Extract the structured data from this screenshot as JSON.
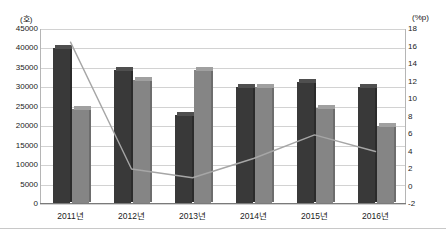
{
  "chart_data": {
    "type": "bar",
    "title": "",
    "subtitle": "",
    "xlabel": "",
    "ylabel": "(호)",
    "y2label": "(%p)",
    "categories": [
      "2011년",
      "2012년",
      "2013년",
      "2014년",
      "2015년",
      "2016년"
    ],
    "series": [
      {
        "name": "series-dark-bar",
        "type": "bar",
        "axis": "left",
        "color": "#393939",
        "values": [
          40000,
          34500,
          23000,
          30000,
          31500,
          30000
        ]
      },
      {
        "name": "series-gray-bar",
        "type": "bar",
        "axis": "left",
        "color": "#858585",
        "values": [
          24500,
          32000,
          34500,
          30200,
          24800,
          20000
        ]
      },
      {
        "name": "series-line",
        "type": "line",
        "axis": "right",
        "color": "#a6a6a6",
        "values": [
          16.5,
          2.0,
          1.0,
          3.2,
          5.9,
          4.0
        ]
      }
    ],
    "ylim": [
      0,
      45000
    ],
    "yticks": [
      "45000",
      "40000",
      "35000",
      "30000",
      "25000",
      "20000",
      "15000",
      "10000",
      "5000",
      "0"
    ],
    "ytick_values": [
      45000,
      40000,
      35000,
      30000,
      25000,
      20000,
      15000,
      10000,
      5000,
      0
    ],
    "y2lim": [
      -2,
      18
    ],
    "y2ticks": [
      "18",
      "16",
      "14",
      "12",
      "10",
      "8",
      "6",
      "4",
      "2",
      "0",
      "-2"
    ],
    "y2tick_values": [
      18,
      16,
      14,
      12,
      10,
      8,
      6,
      4,
      2,
      0,
      -2
    ],
    "grid": true,
    "legend": "none",
    "legend_position": "none"
  }
}
